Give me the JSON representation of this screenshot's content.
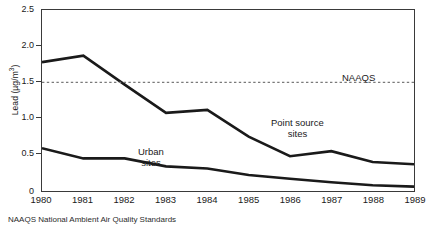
{
  "chart_data": {
    "type": "line",
    "title": "",
    "subtitle": "",
    "xlabel": "",
    "ylabel": "Lead (µg/m³)",
    "ylabel_parts": {
      "text": "Lead (µg/m",
      "sup": "3",
      "tail": ")"
    },
    "categories": [
      "1980",
      "1981",
      "1982",
      "1983",
      "1984",
      "1985",
      "1986",
      "1987",
      "1988",
      "1989"
    ],
    "x": [
      1980,
      1981,
      1982,
      1983,
      1984,
      1985,
      1986,
      1987,
      1988,
      1989
    ],
    "xlim": [
      1980,
      1989
    ],
    "ylim": [
      0,
      2.5
    ],
    "ytick_labels": [
      "2.5",
      "2.0",
      "1.5",
      "1.0",
      "0.5",
      "0"
    ],
    "ytick_values": [
      2.5,
      2.0,
      1.5,
      1.0,
      0.5,
      0
    ],
    "grid": false,
    "legend": "inline-annotations",
    "series": [
      {
        "name": "Point source sites",
        "color": "#1a1a1a",
        "style": "solid",
        "width": 2.6,
        "values": [
          1.78,
          1.87,
          1.47,
          1.08,
          1.12,
          0.75,
          0.48,
          0.55,
          0.4,
          0.37
        ]
      },
      {
        "name": "Urban sites",
        "color": "#1a1a1a",
        "style": "solid",
        "width": 2.6,
        "values": [
          0.59,
          0.45,
          0.45,
          0.34,
          0.31,
          0.22,
          0.17,
          0.12,
          0.08,
          0.06
        ]
      }
    ],
    "reference_lines": [
      {
        "name": "NAAQS",
        "value": 1.5,
        "orientation": "horizontal",
        "style": "dashed",
        "color": "#7a7a7a",
        "label": "NAAQS"
      }
    ],
    "annotations": [
      {
        "name": "NAAQS",
        "text": "NAAQS",
        "lines": [
          "NAAQS"
        ],
        "x": 1987.05,
        "y": 1.62
      },
      {
        "name": "Point source sites",
        "text": "Point source sites",
        "lines": [
          "Point source",
          "sites"
        ],
        "x": 1985.0,
        "y": 1.03
      },
      {
        "name": "Urban sites",
        "text": "Urban sites",
        "lines": [
          "Urban",
          "sites"
        ],
        "x": 1981.4,
        "y": 0.66
      }
    ]
  },
  "axes": {
    "y_title": "Lead (µg/m",
    "y_title_sup": "3",
    "y_title_tail": ")",
    "y_ticks": [
      "2.5",
      "2.0",
      "1.5",
      "1.0",
      "0.5",
      "0"
    ],
    "x_ticks": [
      "1980",
      "1981",
      "1982",
      "1983",
      "1984",
      "1985",
      "1986",
      "1987",
      "1988",
      "1989"
    ]
  },
  "annotations": {
    "naaqs": "NAAQS",
    "point_source_line1": "Point source",
    "point_source_line2": "sites",
    "urban_line1": "Urban",
    "urban_line2": "sites"
  },
  "footnote": {
    "text": "NAAQS National Ambient Air Quality Standards"
  },
  "colors": {
    "line": "#1a1a1a",
    "axis": "#3a3a3a",
    "reference": "#7a7a7a",
    "background": "#ffffff",
    "text": "#1a1a1a"
  }
}
